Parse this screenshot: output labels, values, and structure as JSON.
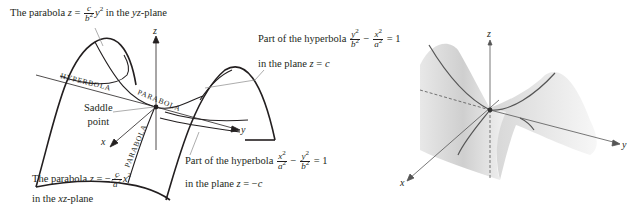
{
  "left_diagram": {
    "title": "Hyperbolic paraboloid saddle (line drawing)",
    "axes": {
      "x": "x",
      "y": "y",
      "z": "z"
    },
    "curve_labels": {
      "hyperbola": "HYPERBOLA",
      "parabola_top": "PARABOLA",
      "parabola_front": "PARABOLA",
      "parabola_right": "PARABOLA"
    },
    "saddle_point": {
      "line1": "Saddle",
      "line2": "point"
    },
    "annotations": {
      "yz_parabola": {
        "prefix": "The parabola ",
        "var": "z",
        "eq": " = ",
        "frac_num": "c",
        "frac_den": "b",
        "den_exp": "2",
        "term": "y",
        "term_exp": "2",
        "suffix": " in the ",
        "plane": "yz",
        "plane_suffix": "-plane"
      },
      "xz_parabola": {
        "prefix": "The parabola ",
        "var": "z",
        "eq": " = −",
        "frac_num": "c",
        "frac_den": "a",
        "den_exp": "2",
        "term": "x",
        "term_exp": "2",
        "line2_prefix": "in the ",
        "plane": "xz",
        "plane_suffix": "-plane"
      },
      "hyperbola_zc": {
        "prefix": "Part of the hyperbola ",
        "f1_num": "y",
        "f1_num_exp": "2",
        "f1_den": "b",
        "f1_den_exp": "2",
        "minus": " − ",
        "f2_num": "x",
        "f2_num_exp": "2",
        "f2_den": "a",
        "f2_den_exp": "2",
        "rhs": " = 1",
        "line2_prefix": "in the plane ",
        "line2_var": "z",
        "line2_eq": " = ",
        "line2_val": "c"
      },
      "hyperbola_zminusc": {
        "prefix": "Part of the hyperbola ",
        "f1_num": "x",
        "f1_num_exp": "2",
        "f1_den": "a",
        "f1_den_exp": "2",
        "minus": " − ",
        "f2_num": "y",
        "f2_num_exp": "2",
        "f2_den": "b",
        "f2_den_exp": "2",
        "rhs": " = 1",
        "line2_prefix": "in the plane ",
        "line2_var": "z",
        "line2_eq": " = −",
        "line2_val": "c"
      }
    }
  },
  "right_diagram": {
    "title": "Shaded saddle surface",
    "axes": {
      "x": "x",
      "y": "y",
      "z": "z"
    },
    "colors": {
      "surface": "#d9d9d9",
      "curve": "#555555",
      "axis": "#555555"
    }
  },
  "colors": {
    "ink": "#231f20",
    "leader": "#8a8a8a"
  }
}
